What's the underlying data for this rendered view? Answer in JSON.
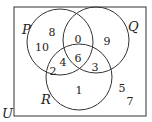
{
  "diagram": {
    "type": "venn",
    "universe_label": "U",
    "sets": [
      {
        "label": "P",
        "cx": 60,
        "cy": 42,
        "r": 33,
        "lx": 22,
        "ly": 34
      },
      {
        "label": "Q",
        "cx": 96,
        "cy": 40,
        "r": 33,
        "lx": 128,
        "ly": 31
      },
      {
        "label": "R",
        "cx": 79,
        "cy": 77,
        "r": 33,
        "lx": 41,
        "ly": 104
      }
    ],
    "regions": [
      {
        "name": "P only",
        "value": "8",
        "x": 52,
        "y": 36
      },
      {
        "name": "P only",
        "value": "10",
        "x": 42,
        "y": 51
      },
      {
        "name": "P and Q only",
        "value": "0",
        "x": 78,
        "y": 43
      },
      {
        "name": "Q only",
        "value": "9",
        "x": 107,
        "y": 45
      },
      {
        "name": "P and R only",
        "value": "2",
        "x": 53,
        "y": 75
      },
      {
        "name": "P and R only",
        "value": "4",
        "x": 63,
        "y": 66
      },
      {
        "name": "P and Q and R",
        "value": "6",
        "x": 78,
        "y": 62
      },
      {
        "name": "Q and R only",
        "value": "3",
        "x": 95,
        "y": 71
      },
      {
        "name": "R only",
        "value": "1",
        "x": 79,
        "y": 94
      },
      {
        "name": "outside",
        "value": "5",
        "x": 122,
        "y": 92
      },
      {
        "name": "outside",
        "value": "7",
        "x": 130,
        "y": 105
      }
    ]
  }
}
